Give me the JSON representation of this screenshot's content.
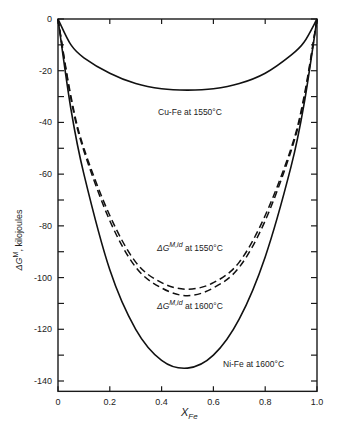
{
  "chart_data": {
    "type": "line",
    "title": "",
    "xlabel": "X_Fe",
    "xlabel_main": "X",
    "xlabel_sub": "Fe",
    "ylabel": "ΔG^M, kilojoules",
    "ylabel_main": "ΔG",
    "ylabel_sup": "M",
    "ylabel_rest": ", kilojoules",
    "xlim": [
      0,
      1.0
    ],
    "ylim": [
      -144,
      0
    ],
    "grid": false,
    "legend": "none (curves labeled inline)",
    "x_ticks": [
      "0",
      "0.2",
      "0.4",
      "0.6",
      "0.8",
      "1.0"
    ],
    "y_ticks": [
      "0",
      "-20",
      "-40",
      "-60",
      "-80",
      "-100",
      "-120",
      "-140"
    ],
    "x": [
      0,
      0.05,
      0.1,
      0.2,
      0.3,
      0.4,
      0.5,
      0.6,
      0.7,
      0.8,
      0.9,
      0.95,
      1.0
    ],
    "series": [
      {
        "name": "Cu-Fe at 1550°C",
        "style": "solid",
        "values": [
          0,
          -10,
          -15,
          -21,
          -25,
          -27,
          -27.5,
          -27,
          -25,
          -21,
          -14,
          -9,
          0
        ]
      },
      {
        "name": "ΔG^M,id at 1550°C",
        "style": "dashed",
        "values": [
          0,
          -30,
          -50,
          -76,
          -94,
          -102,
          -104.5,
          -102,
          -94,
          -76,
          -50,
          -30,
          0
        ]
      },
      {
        "name": "ΔG^M,id at 1600°C",
        "style": "dashed",
        "values": [
          0,
          -31,
          -51,
          -78,
          -96,
          -104,
          -107,
          -104,
          -96,
          -78,
          -51,
          -31,
          0
        ]
      },
      {
        "name": "Ni-Fe at 1600°C",
        "style": "solid",
        "values": [
          0,
          -35,
          -60,
          -97,
          -120,
          -132,
          -135,
          -130,
          -116,
          -92,
          -57,
          -33,
          0
        ]
      }
    ],
    "annotations": [
      {
        "text": "Cu-Fe at 1550°C"
      },
      {
        "text": "ΔG^M,id at 1550°C"
      },
      {
        "text": "ΔG^M,id at 1600°C"
      },
      {
        "text": "Ni-Fe at 1600°C"
      }
    ]
  },
  "labels": {
    "cufe": "Cu-Fe at 1550°C",
    "id1550_main": "ΔG",
    "id1550_sup": "M,id",
    "id1550_rest": " at 1550°C",
    "id1600_main": "ΔG",
    "id1600_sup": "M,id",
    "id1600_rest": " at 1600°C",
    "nife": "Ni-Fe at 1600°C"
  }
}
